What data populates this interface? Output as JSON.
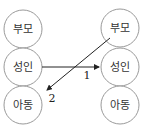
{
  "diagram": {
    "left_column": [
      {
        "id": "L-parent",
        "label": "부모"
      },
      {
        "id": "L-adult",
        "label": "성인"
      },
      {
        "id": "L-child",
        "label": "아동"
      }
    ],
    "right_column": [
      {
        "id": "R-parent",
        "label": "부모"
      },
      {
        "id": "R-adult",
        "label": "성인"
      },
      {
        "id": "R-child",
        "label": "아동"
      }
    ],
    "edges": [
      {
        "from": "L-adult",
        "to": "R-adult",
        "label": "1"
      },
      {
        "from": "R-parent",
        "to": "L-child",
        "label": "2"
      }
    ]
  },
  "colors": {
    "circle_stroke": "#9a9a9a",
    "arrow": "#222222",
    "text": "#333333"
  }
}
